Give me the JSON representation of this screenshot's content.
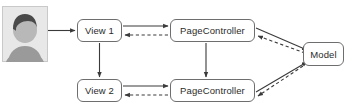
{
  "diagram": {
    "background_color": "#ffffff",
    "node_border_color": "#6e6e6e",
    "edge_color": "#3a3a3a",
    "nodes": [
      {
        "id": "actor",
        "label": "",
        "type": "actor-avatar"
      },
      {
        "id": "view1",
        "label": "View 1",
        "type": "box"
      },
      {
        "id": "view2",
        "label": "View 2",
        "type": "box"
      },
      {
        "id": "pc1",
        "label": "PageController",
        "type": "box"
      },
      {
        "id": "pc2",
        "label": "PageController",
        "type": "box"
      },
      {
        "id": "model",
        "label": "Model",
        "type": "box"
      }
    ],
    "edges": [
      {
        "from": "actor",
        "to": "view1",
        "style": "solid",
        "direction": "right"
      },
      {
        "from": "view1",
        "to": "pc1",
        "style": "solid",
        "direction": "right"
      },
      {
        "from": "pc1",
        "to": "view1",
        "style": "dashed",
        "direction": "left"
      },
      {
        "from": "view2",
        "to": "pc2",
        "style": "solid",
        "direction": "right"
      },
      {
        "from": "pc2",
        "to": "view2",
        "style": "dashed",
        "direction": "left"
      },
      {
        "from": "view1",
        "to": "view2",
        "style": "solid",
        "direction": "down"
      },
      {
        "from": "pc1",
        "to": "pc2",
        "style": "solid",
        "direction": "down"
      },
      {
        "from": "pc1",
        "to": "model",
        "style": "solid",
        "direction": "down-right"
      },
      {
        "from": "model",
        "to": "pc1",
        "style": "dashed",
        "direction": "up-left"
      },
      {
        "from": "pc2",
        "to": "model",
        "style": "solid",
        "direction": "up-right"
      },
      {
        "from": "model",
        "to": "pc2",
        "style": "dashed",
        "direction": "down-left"
      }
    ]
  },
  "actor": {
    "name": "user-actor",
    "hair_color": "#4a4a4a",
    "face_color": "#b5b5b5",
    "body_color": "#9a9a9a",
    "panel_color": "#e8e8e8"
  }
}
